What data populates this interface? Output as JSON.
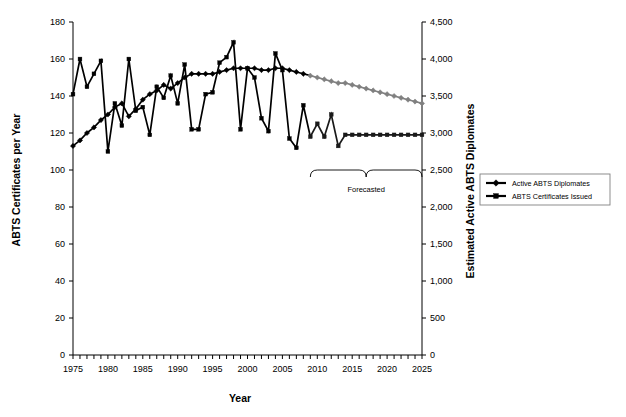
{
  "chart_data": {
    "type": "line",
    "title": "",
    "xlabel": "Year",
    "ylabel": "ABTS Certificates per Year",
    "y2label": "Estimated Active ABTS Diplomates",
    "xlim": [
      1975,
      2025
    ],
    "ylim": [
      0,
      180
    ],
    "y2lim": [
      0,
      4500
    ],
    "grid": false,
    "legend_position": "right-middle",
    "x_tick_labels": [
      "1975",
      "1980",
      "1985",
      "1990",
      "1995",
      "2000",
      "2005",
      "2010",
      "2015",
      "2020",
      "2025"
    ],
    "x_tick_values": [
      1975,
      1980,
      1985,
      1990,
      1995,
      2000,
      2005,
      2010,
      2015,
      2020,
      2025
    ],
    "x_minor_tick_step": 1,
    "y_tick_labels": [
      "0",
      "20",
      "40",
      "60",
      "80",
      "100",
      "120",
      "140",
      "160",
      "180"
    ],
    "y_tick_values": [
      0,
      20,
      40,
      60,
      80,
      100,
      120,
      140,
      160,
      180
    ],
    "y2_tick_labels": [
      "0",
      "500",
      "1,000",
      "1,500",
      "2,000",
      "2,500",
      "3,000",
      "3,500",
      "4,000",
      "4,500"
    ],
    "y2_tick_values": [
      0,
      500,
      1000,
      1500,
      2000,
      2500,
      3000,
      3500,
      4000,
      4500
    ],
    "annotations": [
      {
        "text": "Forecasted",
        "type": "brace",
        "x_start": 2009,
        "x_end": 2025
      }
    ],
    "series": [
      {
        "name": "ABTS Certificates Issued",
        "axis": "left",
        "marker": "square",
        "color": "#000000",
        "forecast_color": "#1a1a1a",
        "forecast_start_year": 2009,
        "x": [
          1975,
          1976,
          1977,
          1978,
          1979,
          1980,
          1981,
          1982,
          1983,
          1984,
          1985,
          1986,
          1987,
          1988,
          1989,
          1990,
          1991,
          1992,
          1993,
          1994,
          1995,
          1996,
          1997,
          1998,
          1999,
          2000,
          2001,
          2002,
          2003,
          2004,
          2005,
          2006,
          2007,
          2008,
          2009,
          2010,
          2011,
          2012,
          2013,
          2014,
          2015,
          2016,
          2017,
          2018,
          2019,
          2020,
          2021,
          2022,
          2023,
          2024,
          2025
        ],
        "values": [
          141,
          160,
          145,
          152,
          159,
          110,
          136,
          124,
          160,
          132,
          134,
          119,
          145,
          139,
          151,
          136,
          157,
          122,
          122,
          141,
          142,
          158,
          161,
          169,
          122,
          155,
          150,
          128,
          121,
          163,
          154,
          117,
          112,
          135,
          118,
          125,
          118,
          130,
          113,
          119,
          119,
          119,
          119,
          119,
          119,
          119,
          119,
          119,
          119,
          119,
          119
        ]
      },
      {
        "name": "Active ABTS Diplomates",
        "axis": "right",
        "marker": "diamond",
        "color": "#000000",
        "forecast_color": "#808080",
        "forecast_start_year": 2009,
        "x": [
          1975,
          1976,
          1977,
          1978,
          1979,
          1980,
          1981,
          1982,
          1983,
          1984,
          1985,
          1986,
          1987,
          1988,
          1989,
          1990,
          1991,
          1992,
          1993,
          1994,
          1995,
          1996,
          1997,
          1998,
          1999,
          2000,
          2001,
          2002,
          2003,
          2004,
          2005,
          2006,
          2007,
          2008,
          2009,
          2010,
          2011,
          2012,
          2013,
          2014,
          2015,
          2016,
          2017,
          2018,
          2019,
          2020,
          2021,
          2022,
          2023,
          2024,
          2025
        ],
        "values_left_scale": [
          113,
          116,
          120,
          123,
          127,
          130,
          134,
          136,
          129,
          133,
          138,
          141,
          143,
          146,
          144,
          147,
          150,
          152,
          152,
          152,
          152,
          153,
          154,
          155,
          155,
          155,
          155,
          154,
          154,
          155,
          155,
          154,
          153,
          152,
          151,
          150,
          149,
          148,
          147,
          147,
          146,
          145,
          144,
          143,
          142,
          141,
          140,
          139,
          138,
          137,
          136
        ]
      }
    ]
  },
  "legend": {
    "items": [
      {
        "label": "Active ABTS Diplomates",
        "marker": "diamond",
        "color": "#000000"
      },
      {
        "label": "ABTS Certificates Issued",
        "marker": "square",
        "color": "#000000"
      }
    ]
  }
}
